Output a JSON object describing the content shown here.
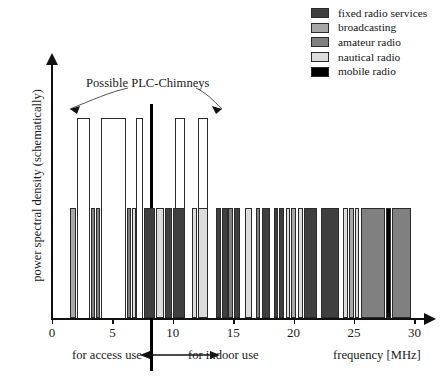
{
  "legend": {
    "items": [
      {
        "label": "fixed radio services",
        "color": "#3f3f3f",
        "key": "fixed"
      },
      {
        "label": "broadcasting",
        "color": "#a8a8a8",
        "key": "broadcasting"
      },
      {
        "label": "amateur radio",
        "color": "#808080",
        "key": "amateur"
      },
      {
        "label": "nautical radio",
        "color": "#dcdcdc",
        "key": "nautical"
      },
      {
        "label": "mobile radio",
        "color": "#000000",
        "key": "mobile"
      }
    ]
  },
  "annotations": {
    "plc_chimneys": "Possible PLC-Chimneys",
    "access_use": "for access use",
    "indoor_use": "for indoor use",
    "frequency_axis": "frequency [MHz]",
    "divider_mhz": 10
  },
  "chart_data": {
    "type": "bar",
    "title": "",
    "xlabel": "frequency [MHz]",
    "ylabel": "power spectral density (schematically)",
    "xlim": [
      0,
      31
    ],
    "ylim": [
      0,
      1.25
    ],
    "grid": false,
    "legend_position": "top-right",
    "xticks": [
      0,
      5,
      10,
      15,
      20,
      25,
      30
    ],
    "xticklabels": [
      "0",
      "5",
      "10",
      "15",
      "20",
      "25",
      "30"
    ],
    "yticks": [],
    "yticklabels": [],
    "category_colors": {
      "fixed": "#3f3f3f",
      "broadcasting": "#a8a8a8",
      "amateur": "#808080",
      "nautical": "#dcdcdc",
      "mobile": "#000000",
      "chimney": "#ffffff"
    },
    "series": [
      {
        "name": "allocated radio services",
        "note": "bars of normal height = 0.55",
        "bars": [
          {
            "x0": 1.45,
            "x1": 1.95,
            "h": 0.55,
            "cat": "broadcasting"
          },
          {
            "x0": 3.25,
            "x1": 3.55,
            "h": 0.55,
            "cat": "amateur"
          },
          {
            "x0": 3.62,
            "x1": 3.95,
            "h": 0.55,
            "cat": "amateur"
          },
          {
            "x0": 6.2,
            "x1": 6.55,
            "h": 0.55,
            "cat": "amateur"
          },
          {
            "x0": 6.62,
            "x1": 6.95,
            "h": 0.55,
            "cat": "nautical"
          },
          {
            "x0": 7.6,
            "x1": 8.55,
            "h": 0.55,
            "cat": "fixed"
          },
          {
            "x0": 8.6,
            "x1": 9.3,
            "h": 0.55,
            "cat": "nautical"
          },
          {
            "x0": 9.35,
            "x1": 9.9,
            "h": 0.55,
            "cat": "fixed"
          },
          {
            "x0": 10.05,
            "x1": 11.05,
            "h": 0.55,
            "cat": "fixed"
          },
          {
            "x0": 11.6,
            "x1": 12.0,
            "h": 0.55,
            "cat": "nautical"
          },
          {
            "x0": 12.1,
            "x1": 12.95,
            "h": 0.55,
            "cat": "nautical"
          },
          {
            "x0": 13.55,
            "x1": 13.95,
            "h": 0.55,
            "cat": "fixed"
          },
          {
            "x0": 14.05,
            "x1": 14.55,
            "h": 0.55,
            "cat": "fixed"
          },
          {
            "x0": 14.6,
            "x1": 15.0,
            "h": 0.55,
            "cat": "amateur"
          },
          {
            "x0": 15.1,
            "x1": 15.55,
            "h": 0.55,
            "cat": "fixed"
          },
          {
            "x0": 15.95,
            "x1": 16.55,
            "h": 0.55,
            "cat": "nautical"
          },
          {
            "x0": 16.9,
            "x1": 17.25,
            "h": 0.55,
            "cat": "amateur"
          },
          {
            "x0": 17.35,
            "x1": 18.05,
            "h": 0.55,
            "cat": "fixed"
          },
          {
            "x0": 18.35,
            "x1": 18.7,
            "h": 0.55,
            "cat": "fixed"
          },
          {
            "x0": 18.8,
            "x1": 19.2,
            "h": 0.55,
            "cat": "fixed"
          },
          {
            "x0": 19.35,
            "x1": 19.7,
            "h": 0.55,
            "cat": "nautical"
          },
          {
            "x0": 19.8,
            "x1": 20.2,
            "h": 0.55,
            "cat": "broadcasting"
          },
          {
            "x0": 20.35,
            "x1": 20.8,
            "h": 0.55,
            "cat": "nautical"
          },
          {
            "x0": 20.9,
            "x1": 21.95,
            "h": 0.55,
            "cat": "fixed"
          },
          {
            "x0": 22.3,
            "x1": 23.8,
            "h": 0.55,
            "cat": "fixed"
          },
          {
            "x0": 24.1,
            "x1": 24.5,
            "h": 0.55,
            "cat": "nautical"
          },
          {
            "x0": 24.6,
            "x1": 25.0,
            "h": 0.55,
            "cat": "broadcasting"
          },
          {
            "x0": 25.1,
            "x1": 25.45,
            "h": 0.55,
            "cat": "nautical"
          },
          {
            "x0": 25.55,
            "x1": 27.55,
            "h": 0.55,
            "cat": "amateur"
          },
          {
            "x0": 27.65,
            "x1": 28.05,
            "h": 0.55,
            "cat": "mobile"
          },
          {
            "x0": 28.15,
            "x1": 29.7,
            "h": 0.55,
            "cat": "amateur"
          }
        ]
      },
      {
        "name": "Possible PLC-Chimneys",
        "note": "tall white outlined bars, height = 1.0",
        "bars": [
          {
            "x0": 2.05,
            "x1": 3.15,
            "h": 1.0,
            "cat": "chimney"
          },
          {
            "x0": 4.05,
            "x1": 6.1,
            "h": 1.0,
            "cat": "chimney"
          },
          {
            "x0": 6.98,
            "x1": 7.52,
            "h": 1.0,
            "cat": "chimney"
          },
          {
            "x0": 10.15,
            "x1": 11.0,
            "h": 1.0,
            "cat": "chimney"
          },
          {
            "x0": 12.05,
            "x1": 12.9,
            "h": 1.0,
            "cat": "chimney"
          }
        ]
      }
    ]
  }
}
